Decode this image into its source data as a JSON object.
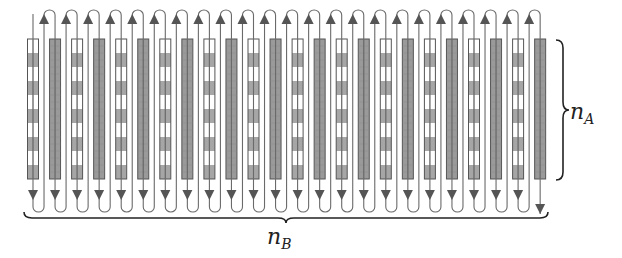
{
  "diagram": {
    "columns": {
      "count": 24,
      "first_x": 33,
      "spacing": 22.05,
      "width": 11,
      "top": 39,
      "bottom": 179,
      "pattern": [
        "checkered",
        "solid"
      ],
      "checker_rows": 10
    },
    "path": {
      "top_loop_y": 10,
      "bottom_loop_y": 212,
      "arrow_direction_in_columns": "down",
      "arrow_direction_in_gaps": "up"
    },
    "colors": {
      "stroke": "#555555",
      "solid_fill": "#9a9a9a",
      "checker_gray": "#a6a6a6",
      "checker_white": "#ffffff",
      "brace": "#222222"
    },
    "labels": {
      "vertical_brace": {
        "base": "n",
        "sub": "A"
      },
      "horizontal_brace": {
        "base": "n",
        "sub": "B"
      }
    }
  }
}
